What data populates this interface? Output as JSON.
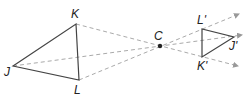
{
  "diagram": {
    "center": {
      "label": "C",
      "x": 160,
      "y": 46
    },
    "original_triangle": {
      "vertices": [
        {
          "label": "J",
          "x": 13,
          "y": 66,
          "lx": 4,
          "ly": 76
        },
        {
          "label": "K",
          "x": 76,
          "y": 24,
          "lx": 71,
          "ly": 18
        },
        {
          "label": "L",
          "x": 79,
          "y": 80,
          "lx": 74,
          "ly": 94
        }
      ]
    },
    "image_triangle": {
      "vertices": [
        {
          "label": "J'",
          "x": 234,
          "y": 37,
          "lx": 229,
          "ly": 50
        },
        {
          "label": "K'",
          "x": 202,
          "y": 57,
          "lx": 197,
          "ly": 70
        },
        {
          "label": "L'",
          "x": 202,
          "y": 29,
          "lx": 197,
          "ly": 24
        }
      ]
    },
    "rays": [
      {
        "from": "K",
        "through": "C",
        "to": "K'",
        "arrow_end": {
          "x": 238,
          "y": 66
        }
      },
      {
        "from": "J",
        "through": "C",
        "to": "J'",
        "arrow_end": {
          "x": 242,
          "y": 35
        }
      },
      {
        "from": "L",
        "through": "C",
        "to": "L'",
        "arrow_end": {
          "x": 239,
          "y": 14
        }
      }
    ],
    "colors": {
      "solid": "#444444",
      "dashed": "#aaaaaa",
      "point": "#222222"
    }
  }
}
